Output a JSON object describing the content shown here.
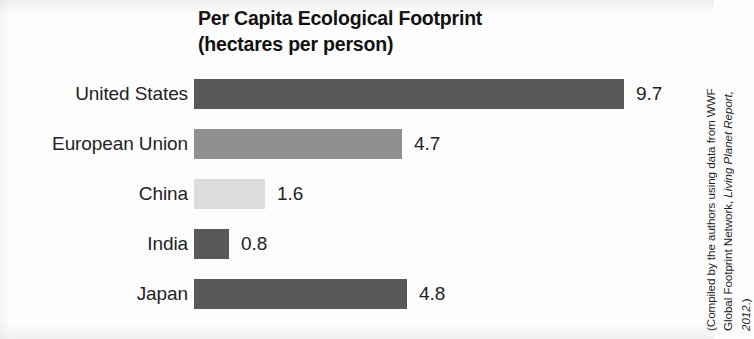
{
  "title": {
    "line1": "Per Capita Ecological Footprint",
    "line2": "(hectares per person)"
  },
  "source_note": {
    "line1_plain": "(Compiled by the authors using data from WWF",
    "line2_plain": "Global Footprint Network, ",
    "line2_italic": "Living Planet Report,",
    "line3_italic": "2012",
    "line3_plain": ".)"
  },
  "chart_data": {
    "type": "bar",
    "orientation": "horizontal",
    "title": "Per Capita Ecological Footprint (hectares per person)",
    "xlabel": "",
    "ylabel": "",
    "unit": "hectares per person",
    "xlim": [
      0,
      9.7
    ],
    "grid": false,
    "legend": "none",
    "value_labels": true,
    "categories": [
      "United States",
      "European Union",
      "China",
      "India",
      "Japan"
    ],
    "values": [
      9.7,
      4.7,
      1.6,
      0.8,
      4.8
    ],
    "value_text": [
      "9.7",
      "4.7",
      "1.6",
      "0.8",
      "4.8"
    ],
    "bar_colors": [
      "#585858",
      "#909090",
      "#dcdcdc",
      "#585858",
      "#585858"
    ],
    "bars": [
      {
        "label": "United States",
        "value": 9.7,
        "value_text": "9.7",
        "color": "#585858"
      },
      {
        "label": "European Union",
        "value": 4.7,
        "value_text": "4.7",
        "color": "#909090"
      },
      {
        "label": "China",
        "value": 1.6,
        "value_text": "1.6",
        "color": "#dcdcdc"
      },
      {
        "label": "India",
        "value": 0.8,
        "value_text": "0.8",
        "color": "#585858"
      },
      {
        "label": "Japan",
        "value": 4.8,
        "value_text": "4.8",
        "color": "#585858"
      }
    ]
  }
}
